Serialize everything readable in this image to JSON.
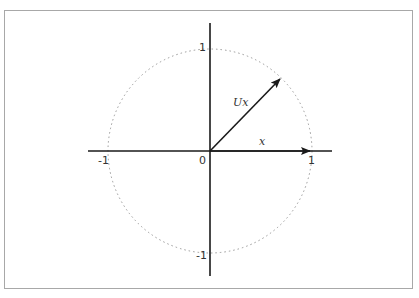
{
  "diagram": {
    "axes": {
      "x_ticks": [
        {
          "value": -1,
          "label": "-1"
        },
        {
          "value": 0,
          "label": "0"
        },
        {
          "value": 1,
          "label": "1"
        }
      ],
      "y_ticks": [
        {
          "value": 1,
          "label": "1"
        },
        {
          "value": -1,
          "label": "-1"
        }
      ]
    },
    "circle": {
      "radius": 1,
      "style": "dotted"
    },
    "vectors": [
      {
        "name": "x",
        "label": "x",
        "from": [
          0,
          0
        ],
        "to": [
          1,
          0
        ]
      },
      {
        "name": "Ux",
        "label": "Ux",
        "from": [
          0,
          0
        ],
        "to": [
          0.707,
          0.707
        ]
      }
    ],
    "labels": {
      "origin": "0",
      "x_pos": "1",
      "x_neg": "-1",
      "y_pos": "1",
      "y_neg": "-1",
      "vector_x": "x",
      "vector_ux": "Ux"
    },
    "colors": {
      "axis": "#1a1a1a",
      "circle": "#999999",
      "frame": "#a8a8a8",
      "vector": "#1a1a1a"
    }
  }
}
